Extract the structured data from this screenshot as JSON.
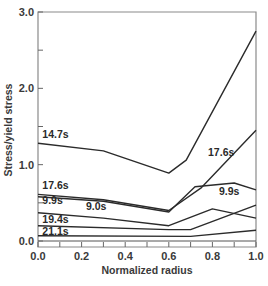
{
  "chart_data": {
    "type": "line",
    "title": "",
    "xlabel": "Normalized radius",
    "ylabel": "Stress/yield stress",
    "xlim": [
      0.0,
      1.0
    ],
    "ylim": [
      0.0,
      3.0
    ],
    "xticks": [
      "0.0",
      "0.2",
      "0.4",
      "0.6",
      "0.8",
      "1.0"
    ],
    "yticks": [
      "0.0",
      "1.0",
      "2.0",
      "3.0"
    ],
    "grid": false,
    "legend": "inline curve labels",
    "series": [
      {
        "name": "14.7s",
        "x": [
          0.0,
          0.3,
          0.6,
          0.68,
          1.0
        ],
        "y": [
          1.28,
          1.18,
          0.89,
          1.06,
          2.75
        ]
      },
      {
        "name": "17.6s",
        "x": [
          0.0,
          0.3,
          0.6,
          0.75,
          1.0
        ],
        "y": [
          0.61,
          0.54,
          0.4,
          0.7,
          1.45
        ]
      },
      {
        "name": "9.9s",
        "x": [
          0.0,
          0.3,
          0.6,
          0.72,
          0.9,
          1.0
        ],
        "y": [
          0.58,
          0.52,
          0.38,
          0.71,
          0.76,
          0.67
        ]
      },
      {
        "name": "9.0s",
        "x": [
          0.0,
          0.3,
          0.6,
          0.8,
          1.0
        ],
        "y": [
          0.37,
          0.3,
          0.2,
          0.42,
          0.3
        ]
      },
      {
        "name": "19.4s",
        "x": [
          0.0,
          0.6,
          0.7,
          1.0
        ],
        "y": [
          0.2,
          0.15,
          0.15,
          0.47
        ]
      },
      {
        "name": "21.1s",
        "x": [
          0.0,
          0.7,
          1.0
        ],
        "y": [
          0.07,
          0.06,
          0.14
        ]
      }
    ],
    "labels": [
      {
        "text": "14.7s",
        "x": 0.02,
        "y": 1.35
      },
      {
        "text": "17.6s",
        "x": 0.02,
        "y": 0.68
      },
      {
        "text": "9.9s",
        "x": 0.02,
        "y": 0.48
      },
      {
        "text": "9.0s",
        "x": 0.22,
        "y": 0.4
      },
      {
        "text": "19.4s",
        "x": 0.02,
        "y": 0.23
      },
      {
        "text": "21.1s",
        "x": 0.02,
        "y": 0.08
      },
      {
        "text": "17.6s",
        "x": 0.78,
        "y": 1.12
      },
      {
        "text": "9.9s",
        "x": 0.83,
        "y": 0.6
      }
    ]
  }
}
